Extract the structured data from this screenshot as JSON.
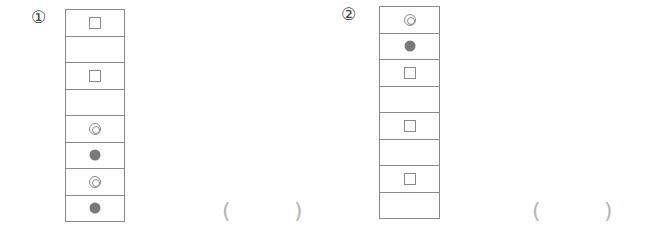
{
  "problems": [
    {
      "label": "①",
      "cells": [
        "square",
        "empty",
        "square",
        "empty",
        "double-circle",
        "filled-circle",
        "double-circle",
        "filled-circle"
      ],
      "answer_open": "(",
      "answer_close": ")",
      "answer_value": ""
    },
    {
      "label": "②",
      "cells": [
        "double-circle",
        "filled-circle",
        "square",
        "empty",
        "square",
        "empty",
        "square",
        "empty"
      ],
      "answer_open": "(",
      "answer_close": ")",
      "answer_value": ""
    }
  ],
  "colors": {
    "border": "#8a8a8a",
    "filled_symbol": "#7a7a7a",
    "paren": "#b5b5b5"
  }
}
